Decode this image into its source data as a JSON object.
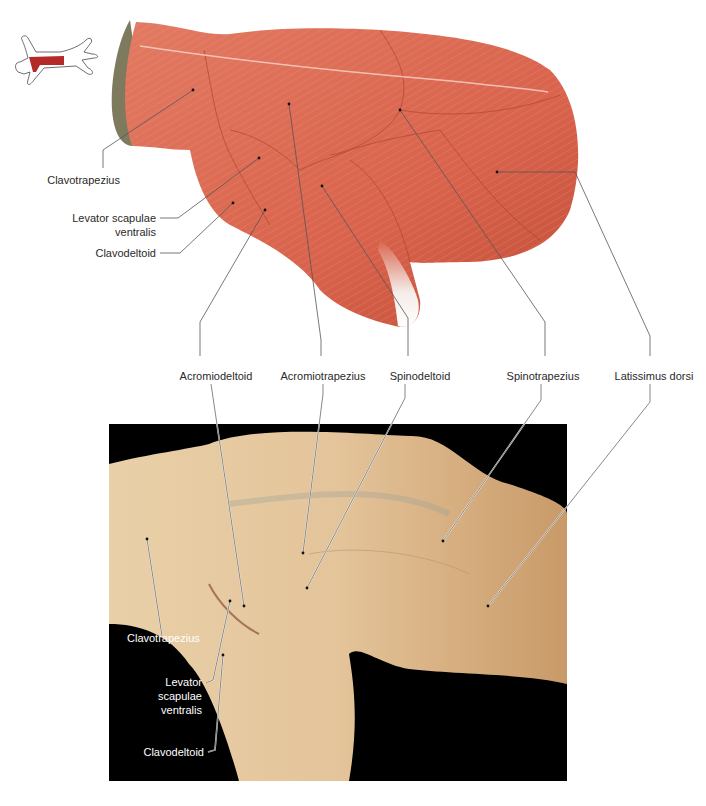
{
  "figure": {
    "orientation_icon": {
      "name": "cat-outline-locator",
      "highlight_color": "#b32a26",
      "outline_color": "#4a4a4a"
    },
    "illustration": {
      "muscle_color": "#d9634c",
      "muscle_shadow": "#b8442f",
      "fur_color": "#7d7a5e",
      "tendon_color": "#f4ece8",
      "labels": {
        "clavotrapezius": "Clavotrapezius",
        "levator_scapulae_ventralis_line1": "Levator scapulae",
        "levator_scapulae_ventralis_line2": "ventralis",
        "clavodeltoid": "Clavodeltoid"
      }
    },
    "shared_labels": {
      "acromiodeltoid": "Acromiodeltoid",
      "acromiotrapezius": "Acromiotrapezius",
      "spinodeltoid": "Spinodeltoid",
      "spinotrapezius": "Spinotrapezius",
      "latissimus_dorsi": "Latissimus dorsi"
    },
    "photo": {
      "background_color": "#000000",
      "tissue_color": "#e2c39a",
      "labels": {
        "clavotrapezius": "Clavotrapezius",
        "levator_line1": "Levator",
        "levator_line2": "scapulae",
        "levator_line3": "ventralis",
        "clavodeltoid": "Clavodeltoid"
      }
    }
  }
}
